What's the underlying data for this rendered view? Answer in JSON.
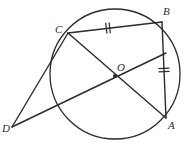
{
  "figure": {
    "kind": "circle-geometry-diagram",
    "width": 189,
    "height": 149,
    "background_color": "#ffffff",
    "stroke_color": "#2b2b2b",
    "label_color": "#2b2b2b"
  },
  "circle": {
    "name": "circle-O",
    "center_x": 115,
    "center_y": 74,
    "radius": 65
  },
  "points": [
    {
      "id": "A",
      "label": "A",
      "x": 166,
      "y": 118,
      "label_x": 168,
      "label_y": 120,
      "on_circle": true
    },
    {
      "id": "B",
      "label": "B",
      "x": 162,
      "y": 22,
      "label_x": 163,
      "label_y": 6,
      "on_circle": true
    },
    {
      "id": "C",
      "label": "C",
      "x": 68,
      "y": 33,
      "label_x": 55,
      "label_y": 24,
      "on_circle": true
    },
    {
      "id": "D",
      "label": "D",
      "x": 12,
      "y": 127,
      "label_x": 2,
      "label_y": 123,
      "on_circle": false
    },
    {
      "id": "O",
      "label": "O",
      "x": 115,
      "y": 76,
      "label_x": 117,
      "label_y": 62,
      "on_circle": false
    }
  ],
  "center_dot": {
    "name": "center-point-O",
    "x": 115,
    "y": 76,
    "radius": 2
  },
  "segments": [
    {
      "id": "CB",
      "from": "C",
      "to": "B",
      "x1": 68,
      "y1": 33,
      "x2": 162,
      "y2": 22,
      "ticks": 2
    },
    {
      "id": "BA",
      "from": "B",
      "to": "A",
      "x1": 162,
      "y1": 22,
      "x2": 166,
      "y2": 118,
      "ticks": 2
    },
    {
      "id": "CA",
      "from": "C",
      "to": "A",
      "x1": 68,
      "y1": 33,
      "x2": 166,
      "y2": 118,
      "ticks": 0
    },
    {
      "id": "DC",
      "from": "D",
      "to": "C",
      "x1": 12,
      "y1": 127,
      "x2": 68,
      "y2": 33,
      "ticks": 0
    },
    {
      "id": "DO",
      "from": "D",
      "to": "O",
      "x1": 12,
      "y1": 127,
      "x2": 166,
      "y2": 53,
      "ticks": 0
    }
  ],
  "tick_marks": [
    {
      "id": "tick-CB",
      "on_segment": "CB",
      "count": 2,
      "center_x": 108,
      "center_y": 28,
      "angle_deg": -6.7,
      "length": 11,
      "spacing": 3.4
    },
    {
      "id": "tick-BA",
      "on_segment": "BA",
      "count": 2,
      "center_x": 164,
      "center_y": 70,
      "angle_deg": 87.6,
      "length": 11,
      "spacing": 3.4
    }
  ]
}
